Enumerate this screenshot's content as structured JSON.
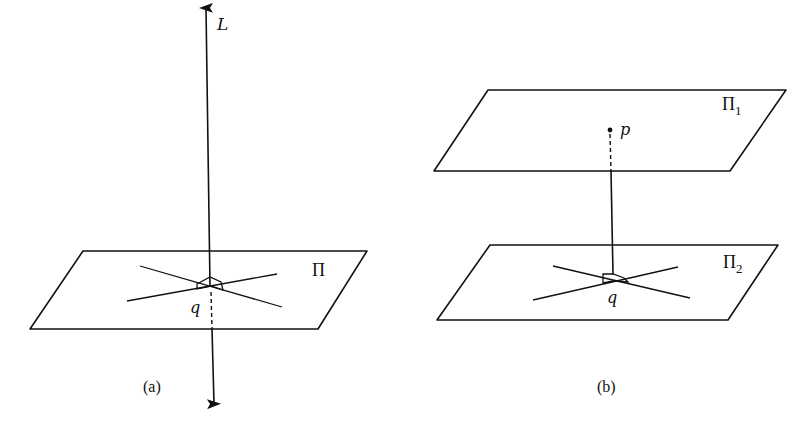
{
  "figure": {
    "panel_a": {
      "caption": "(a)",
      "line_label": "L",
      "plane_label": "Π",
      "point_label": "q"
    },
    "panel_b": {
      "caption": "(b)",
      "upper_plane_label": "Π",
      "upper_plane_subscript": "1",
      "lower_plane_label": "Π",
      "lower_plane_subscript": "2",
      "upper_point_label": "p",
      "lower_point_label": "q"
    },
    "colors": {
      "ink": "#111111",
      "background": "#ffffff"
    }
  }
}
